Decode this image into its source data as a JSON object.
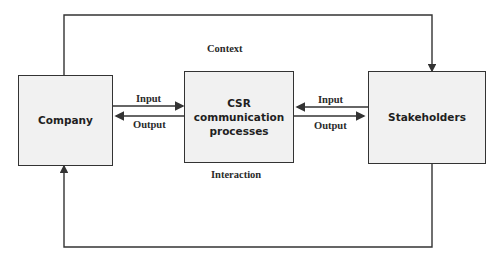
{
  "diagram": {
    "nodes": {
      "company": {
        "label": "Company"
      },
      "csr": {
        "label": "CSR communication processes"
      },
      "stakeholders": {
        "label": "Stakeholders"
      }
    },
    "labels": {
      "context": "Context",
      "interaction": "Interaction",
      "left_input": "Input",
      "left_output": "Output",
      "right_input": "Input",
      "right_output": "Output"
    },
    "edges": [
      {
        "from": "company",
        "to": "csr",
        "label": "Input"
      },
      {
        "from": "csr",
        "to": "company",
        "label": "Output"
      },
      {
        "from": "stakeholders",
        "to": "csr",
        "label": "Input"
      },
      {
        "from": "csr",
        "to": "stakeholders",
        "label": "Output"
      },
      {
        "from": "company",
        "to": "stakeholders",
        "label": "Context",
        "route": "top"
      },
      {
        "from": "stakeholders",
        "to": "company",
        "label": "Interaction",
        "route": "bottom"
      }
    ],
    "colors": {
      "box_fill": "#f1f1f1",
      "stroke": "#333333",
      "text": "#1f1f1f"
    }
  }
}
